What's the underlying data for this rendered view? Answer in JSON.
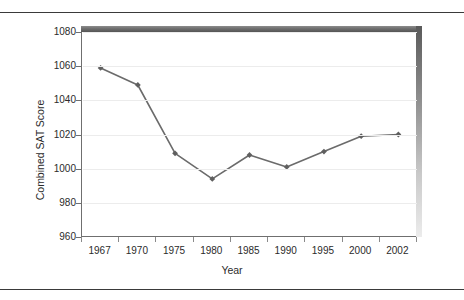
{
  "figure": {
    "background": "#ffffff",
    "frame": {
      "top_rule": "horizontal-rule",
      "bottom_rule": "horizontal-rule",
      "shadow_color": "#6e6e6e"
    }
  },
  "chart_data": {
    "type": "line",
    "title": "",
    "xlabel": "Year",
    "ylabel": "Combined SAT Score",
    "categories": [
      "1967",
      "1970",
      "1975",
      "1980",
      "1985",
      "1990",
      "1995",
      "2000",
      "2002"
    ],
    "values": [
      1059,
      1049,
      1009,
      994,
      1008,
      1001,
      1010,
      1019,
      1020
    ],
    "series": [
      {
        "name": "Combined SAT Score",
        "values": [
          1059,
          1049,
          1009,
          994,
          1008,
          1001,
          1010,
          1019,
          1020
        ]
      }
    ],
    "ylim": [
      960,
      1080
    ],
    "yticks": [
      960,
      980,
      1000,
      1020,
      1040,
      1060,
      1080
    ],
    "ytick_labels": [
      "960",
      "980",
      "1000",
      "1020",
      "1040",
      "1060",
      "1080"
    ],
    "xtick_labels": [
      "1967",
      "1970",
      "1975",
      "1980",
      "1985",
      "1990",
      "1995",
      "2000",
      "2002"
    ],
    "grid": "horizontal",
    "grid_color": "#ececec",
    "legend": "none",
    "line_color": "#6b6b6b",
    "marker": "diamond",
    "marker_color": "#5f5f5f",
    "line_width": 1.6
  }
}
